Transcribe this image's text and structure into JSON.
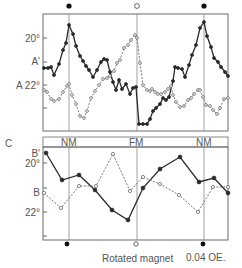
{
  "panel_top": {
    "ylabels": {
      "deg20": "20°",
      "a_prime": "A'",
      "a_22": "A 22°"
    }
  },
  "axis_row": {
    "panel_letter": "C",
    "positions": [
      "NM",
      "FM",
      "NM"
    ]
  },
  "panel_bottom": {
    "ylabels": {
      "b_prime": "B'",
      "deg20": "20°",
      "b": "B",
      "deg22": "22°"
    }
  },
  "footer": {
    "rotated_magnet": "Rotated magnet",
    "field": "0.04 OE."
  },
  "chart_data": [
    {
      "type": "line",
      "panel": "top",
      "title": "",
      "xlabel": "",
      "ylabel": "",
      "y_tick_labels": [
        "20°",
        "A'",
        "A 22°"
      ],
      "x_markers": [
        {
          "label": "NM",
          "marker": "filled"
        },
        {
          "label": "FM",
          "marker": "open"
        },
        {
          "label": "NM",
          "marker": "filled"
        }
      ],
      "series": [
        {
          "name": "A'",
          "style": "solid, filled markers",
          "points": [
            [
              44,
              68
            ],
            [
              48,
              68
            ],
            [
              51,
              67
            ],
            [
              54,
              75
            ],
            [
              59,
              64
            ],
            [
              63,
              50
            ],
            [
              66,
              43
            ],
            [
              69,
              25
            ],
            [
              73,
              34
            ],
            [
              76,
              46
            ],
            [
              80,
              56
            ],
            [
              83,
              61
            ],
            [
              86,
              66
            ],
            [
              89,
              70
            ],
            [
              93,
              77
            ],
            [
              97,
              70
            ],
            [
              101,
              62
            ],
            [
              104,
              59
            ],
            [
              107,
              60
            ],
            [
              110,
              72
            ],
            [
              113,
              82
            ],
            [
              116,
              90
            ],
            [
              119,
              80
            ],
            [
              122,
              89
            ],
            [
              126,
              84
            ],
            [
              130,
              94
            ],
            [
              133,
              88
            ],
            [
              136,
              87
            ],
            [
              139,
              124
            ],
            [
              143,
              124
            ],
            [
              147,
              124
            ],
            [
              150,
              119
            ],
            [
              153,
              111
            ],
            [
              156,
              108
            ],
            [
              160,
              104
            ],
            [
              163,
              98
            ],
            [
              166,
              100
            ],
            [
              169,
              97
            ],
            [
              173,
              81
            ],
            [
              175,
              67
            ],
            [
              178,
              68
            ],
            [
              182,
              69
            ],
            [
              185,
              77
            ],
            [
              189,
              65
            ],
            [
              192,
              55
            ],
            [
              196,
              45
            ],
            [
              200,
              28
            ],
            [
              204,
              22
            ],
            [
              207,
              36
            ],
            [
              211,
              47
            ],
            [
              214,
              58
            ],
            [
              218,
              62
            ],
            [
              221,
              67
            ],
            [
              225,
              72
            ],
            [
              228,
              76
            ]
          ]
        },
        {
          "name": "A",
          "style": "dashed, open markers",
          "points": [
            [
              44,
              90
            ],
            [
              47,
              92
            ],
            [
              51,
              99
            ],
            [
              54,
              101
            ],
            [
              59,
              99
            ],
            [
              63,
              92
            ],
            [
              67,
              86
            ],
            [
              69,
              84
            ],
            [
              72,
              95
            ],
            [
              76,
              104
            ],
            [
              80,
              116
            ],
            [
              84,
              118
            ],
            [
              87,
              111
            ],
            [
              91,
              98
            ],
            [
              95,
              91
            ],
            [
              99,
              85
            ],
            [
              103,
              79
            ],
            [
              107,
              78
            ],
            [
              110,
              76
            ],
            [
              114,
              71
            ],
            [
              117,
              63
            ],
            [
              120,
              60
            ],
            [
              124,
              48
            ],
            [
              128,
              45
            ],
            [
              131,
              40
            ],
            [
              135,
              35
            ],
            [
              137,
              38
            ],
            [
              140,
              63
            ],
            [
              143,
              85
            ],
            [
              147,
              90
            ],
            [
              150,
              91
            ],
            [
              152,
              89
            ],
            [
              155,
              92
            ],
            [
              158,
              94
            ],
            [
              161,
              94
            ],
            [
              165,
              92
            ],
            [
              168,
              89
            ],
            [
              171,
              86
            ],
            [
              173,
              95
            ],
            [
              176,
              102
            ],
            [
              180,
              107
            ],
            [
              184,
              106
            ],
            [
              188,
              100
            ],
            [
              191,
              98
            ],
            [
              194,
              94
            ],
            [
              198,
              90
            ],
            [
              200,
              90
            ],
            [
              203,
              97
            ],
            [
              206,
              105
            ],
            [
              210,
              106
            ],
            [
              213,
              110
            ],
            [
              217,
              114
            ],
            [
              220,
              108
            ],
            [
              224,
              99
            ],
            [
              228,
              98
            ]
          ]
        }
      ]
    },
    {
      "type": "line",
      "panel": "bottom",
      "y_tick_labels": [
        "B'",
        "20°",
        "B",
        "22°"
      ],
      "x_markers": [
        {
          "label": "NM",
          "marker": "filled"
        },
        {
          "label": "FM",
          "marker": "open"
        },
        {
          "label": "NM",
          "marker": "filled"
        }
      ],
      "series": [
        {
          "name": "B'",
          "style": "solid, filled markers",
          "points": [
            [
              46,
              153
            ],
            [
              62,
              180
            ],
            [
              79,
              175
            ],
            [
              95,
              190
            ],
            [
              112,
              210
            ],
            [
              128,
              220
            ],
            [
              143,
              188
            ],
            [
              160,
              169
            ],
            [
              180,
              157
            ],
            [
              199,
              182
            ],
            [
              214,
              178
            ],
            [
              228,
              193
            ]
          ]
        },
        {
          "name": "B",
          "style": "dashed, open markers",
          "points": [
            [
              44,
              193
            ],
            [
              61,
              208
            ],
            [
              79,
              186
            ],
            [
              96,
              186
            ],
            [
              113,
              154
            ],
            [
              130,
              191
            ],
            [
              143,
              177
            ],
            [
              160,
              184
            ],
            [
              179,
              195
            ],
            [
              198,
              212
            ],
            [
              213,
              187
            ],
            [
              228,
              187
            ]
          ]
        }
      ]
    }
  ]
}
